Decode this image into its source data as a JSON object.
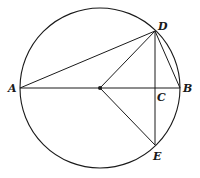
{
  "diagram": {
    "type": "circle-geometry",
    "circle": {
      "cx": 100,
      "cy": 88,
      "r": 80
    },
    "points": {
      "A": {
        "x": 20,
        "y": 88,
        "label": "A"
      },
      "B": {
        "x": 180,
        "y": 88,
        "label": "B"
      },
      "C": {
        "x": 155,
        "y": 88,
        "label": "C"
      },
      "D": {
        "x": 155,
        "y": 31,
        "label": "D"
      },
      "E": {
        "x": 155,
        "y": 145,
        "label": "E"
      },
      "O": {
        "x": 100,
        "y": 88,
        "label": ""
      }
    },
    "segments": [
      "AB",
      "AD",
      "OD",
      "OE",
      "DE",
      "DB"
    ],
    "stroke_color": "#1a1a1a"
  }
}
